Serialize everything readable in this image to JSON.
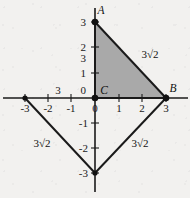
{
  "figure": {
    "colors": {
      "background": "#f2f1ef",
      "shaded_triangle_fill": "#a9a9a9",
      "axis": "#1a1a1a",
      "line": "#1a1a1a",
      "text": "#1a1a1a"
    },
    "points": [
      {
        "name": "A",
        "label": "A",
        "x": 0,
        "y": 3
      },
      {
        "name": "C",
        "label": "C",
        "x": 0,
        "y": 0
      },
      {
        "name": "B",
        "label": "B",
        "x": 3,
        "y": 0
      }
    ],
    "axis_labels": {
      "y_positive": [
        "3",
        "2",
        "1"
      ],
      "y_stray": "3",
      "y_origin": "0",
      "y_negative": [
        "-1",
        "-2",
        "-3"
      ],
      "x_negative": [
        "-3",
        "-2",
        "-1"
      ],
      "x_origin": "0",
      "x_positive": [
        "1",
        "2",
        "3"
      ],
      "x_stray": "3"
    },
    "segment_labels": {
      "hypotenuse_upper": "3√2",
      "lower_left": "3√2",
      "lower_right": "3√2"
    },
    "shaded_triangle": {
      "vertices": [
        [
          0,
          3
        ],
        [
          0,
          0
        ],
        [
          3,
          0
        ]
      ],
      "fill": "#a9a9a9"
    },
    "lower_triangle": {
      "vertices": [
        [
          -3,
          0
        ],
        [
          0,
          -3
        ],
        [
          3,
          0
        ]
      ],
      "fill": "none"
    },
    "axis_range": {
      "x": [
        -3.4,
        3.4
      ],
      "y": [
        -3.4,
        3.6
      ]
    }
  }
}
